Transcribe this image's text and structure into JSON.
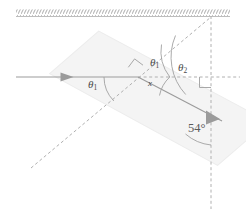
{
  "figure": {
    "type": "optics-refraction-diagram",
    "background_color": "#ffffff",
    "ink_color": "#8a8a8a",
    "text_color": "#4a4a4a",
    "slab_fill_color": "#f4f4f4",
    "slab_stroke_color": "#ededed"
  },
  "labels": {
    "theta1_left": {
      "symbol": "θ",
      "subscript": "1"
    },
    "theta1_mid": {
      "symbol": "θ",
      "subscript": "1"
    },
    "theta2": {
      "symbol": "θ",
      "subscript": "2"
    },
    "x": "x",
    "angle_54": "54°"
  },
  "elements": {
    "boundary_surface": "hatched-horizontal-surface-line",
    "slab": "tilted-rectangular-slab",
    "incident_ray": "horizontal-ray-with-arrowhead",
    "refracted_ray": "ray-inside-and-exiting-slab-with-arrowhead",
    "normal_dashed": "dashed-normal-line-through-interface",
    "vertical_dashed": "dashed-vertical-normal-at-right",
    "horizontal_dashed": "dashed-horizontal-reference-line",
    "right_angle_marker_left": "right-angle-square-at-interface",
    "right_angle_marker_right": "right-angle-square-at-vertical-normal",
    "arc_theta1_left": "angle-arc",
    "arc_theta1_mid": "angle-arc",
    "arc_theta2": "angle-arc",
    "arc_x": "angle-arc",
    "arc_54": "angle-arc"
  }
}
